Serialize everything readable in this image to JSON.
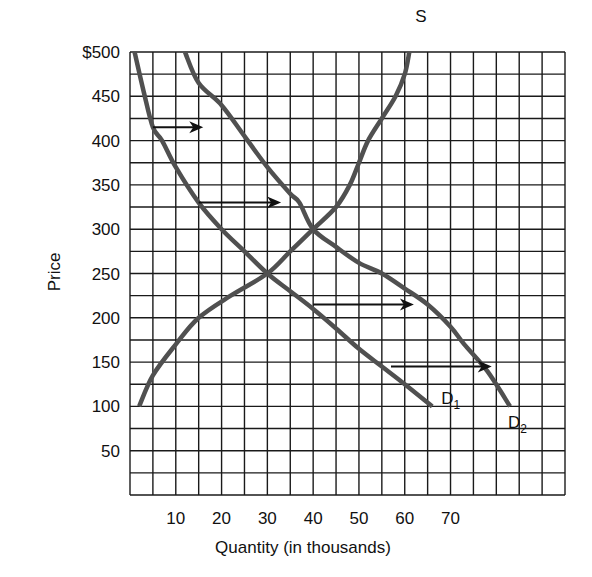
{
  "chart_data": {
    "type": "line",
    "title": "",
    "xlabel": "Quantity (in thousands)",
    "ylabel": "Price",
    "xlim": [
      0,
      95
    ],
    "ylim": [
      0,
      500
    ],
    "grid": true,
    "x_grid_step": 5,
    "y_grid_step": 25,
    "x_ticks": [
      10,
      20,
      30,
      40,
      50,
      60,
      70
    ],
    "x_tick_labels": [
      "10",
      "20",
      "30",
      "40",
      "50",
      "60",
      "70"
    ],
    "y_ticks": [
      50,
      100,
      150,
      200,
      250,
      300,
      350,
      400,
      450,
      500
    ],
    "y_tick_labels": [
      "50",
      "100",
      "150",
      "200",
      "250",
      "300",
      "350",
      "400",
      "450",
      "$500"
    ],
    "series": [
      {
        "name": "S",
        "label": "S",
        "points": [
          [
            2,
            100
          ],
          [
            5,
            135
          ],
          [
            10,
            170
          ],
          [
            15,
            200
          ],
          [
            22,
            225
          ],
          [
            30,
            250
          ],
          [
            35,
            275
          ],
          [
            40,
            300
          ],
          [
            45,
            325
          ],
          [
            48,
            350
          ],
          [
            50,
            375
          ],
          [
            52,
            400
          ],
          [
            55,
            425
          ],
          [
            58,
            450
          ],
          [
            60,
            475
          ],
          [
            61,
            500
          ]
        ]
      },
      {
        "name": "D1",
        "label": "D",
        "subscript": "1",
        "points": [
          [
            1,
            500
          ],
          [
            3,
            455
          ],
          [
            5,
            415
          ],
          [
            7,
            400
          ],
          [
            10,
            370
          ],
          [
            15,
            330
          ],
          [
            20,
            300
          ],
          [
            25,
            275
          ],
          [
            30,
            250
          ],
          [
            35,
            230
          ],
          [
            40,
            210
          ],
          [
            45,
            188
          ],
          [
            50,
            165
          ],
          [
            55,
            145
          ],
          [
            60,
            125
          ],
          [
            66,
            100
          ]
        ]
      },
      {
        "name": "D2",
        "label": "D",
        "subscript": "2",
        "points": [
          [
            12,
            500
          ],
          [
            15,
            465
          ],
          [
            20,
            440
          ],
          [
            25,
            405
          ],
          [
            30,
            370
          ],
          [
            35,
            340
          ],
          [
            37,
            330
          ],
          [
            40,
            300
          ],
          [
            45,
            280
          ],
          [
            50,
            262
          ],
          [
            55,
            250
          ],
          [
            60,
            233
          ],
          [
            65,
            215
          ],
          [
            70,
            190
          ],
          [
            73,
            170
          ],
          [
            78,
            140
          ],
          [
            83,
            100
          ]
        ]
      }
    ],
    "annotations": [
      {
        "type": "arrow",
        "from": [
          5,
          415
        ],
        "to": [
          16,
          415
        ]
      },
      {
        "type": "arrow",
        "from": [
          15,
          330
        ],
        "to": [
          33,
          330
        ]
      },
      {
        "type": "arrow",
        "from": [
          40,
          215
        ],
        "to": [
          62,
          215
        ]
      },
      {
        "type": "arrow",
        "from": [
          57,
          145
        ],
        "to": [
          79,
          145
        ]
      }
    ],
    "legend": "inline curve labels (S at top of supply curve, D1 and D2 at bottom ends of demand curves)"
  },
  "colors": {
    "grid": "#1a1a1a",
    "curve": "#505050",
    "arrow": "#111111",
    "text": "#111111"
  }
}
